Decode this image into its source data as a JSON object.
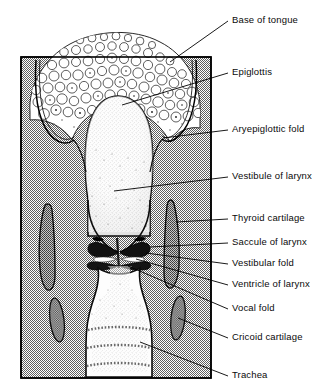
{
  "figure": {
    "background_color": "#ffffff",
    "tissue_gray": "#9a9a9a",
    "outline_color": "#000000",
    "lumen_color": "#fdfdfd",
    "cartilage_color": "#8d8d8d"
  },
  "labels": [
    {
      "id": "base-of-tongue",
      "text": "Base of tongue",
      "x": 232,
      "y": 14,
      "leader": {
        "x1": 228,
        "y1": 21,
        "x2": 170,
        "y2": 62
      }
    },
    {
      "id": "epiglottis",
      "text": "Epiglottis",
      "x": 232,
      "y": 66,
      "leader": {
        "x1": 228,
        "y1": 73,
        "x2": 122,
        "y2": 105
      }
    },
    {
      "id": "aryepiglottic-fold",
      "text": "Aryepiglottic fold",
      "x": 232,
      "y": 123,
      "leader": {
        "x1": 228,
        "y1": 130,
        "x2": 163,
        "y2": 138
      }
    },
    {
      "id": "vestibule-of-larynx",
      "text": "Vestibule of larynx",
      "x": 232,
      "y": 170,
      "leader": {
        "x1": 228,
        "y1": 177,
        "x2": 114,
        "y2": 191
      }
    },
    {
      "id": "thyroid-cartilage",
      "text": "Thyroid cartilage",
      "x": 232,
      "y": 212,
      "leader": {
        "x1": 228,
        "y1": 219,
        "x2": 176,
        "y2": 222
      }
    },
    {
      "id": "saccule-of-larynx",
      "text": "Saccule of larynx",
      "x": 232,
      "y": 236,
      "leader": {
        "x1": 228,
        "y1": 243,
        "x2": 150,
        "y2": 247
      }
    },
    {
      "id": "vestibular-fold",
      "text": "Vestibular fold",
      "x": 232,
      "y": 257,
      "leader": {
        "x1": 228,
        "y1": 264,
        "x2": 146,
        "y2": 253
      }
    },
    {
      "id": "ventricle-of-larynx",
      "text": "Ventricle of larynx",
      "x": 232,
      "y": 278,
      "leader": {
        "x1": 228,
        "y1": 285,
        "x2": 136,
        "y2": 259
      }
    },
    {
      "id": "vocal-fold",
      "text": "Vocal fold",
      "x": 232,
      "y": 302,
      "leader": {
        "x1": 228,
        "y1": 309,
        "x2": 128,
        "y2": 266
      }
    },
    {
      "id": "cricoid-cartilage",
      "text": "Cricoid cartilage",
      "x": 232,
      "y": 331,
      "leader": {
        "x1": 228,
        "y1": 338,
        "x2": 178,
        "y2": 318
      }
    },
    {
      "id": "trachea",
      "text": "Trachea",
      "x": 232,
      "y": 369,
      "leader": {
        "x1": 228,
        "y1": 376,
        "x2": 140,
        "y2": 342
      }
    }
  ],
  "structures": {
    "frame": {
      "left": 21,
      "top": 57,
      "right": 211,
      "bottom": 378
    },
    "tongue_base": "lymphoid follicular tissue at top",
    "epiglottis": "central rounded leaf-shaped body",
    "thyroid_cartilage_bars": 2,
    "cricoid_cartilage_ovals": 2,
    "tracheal_rings": 3
  }
}
